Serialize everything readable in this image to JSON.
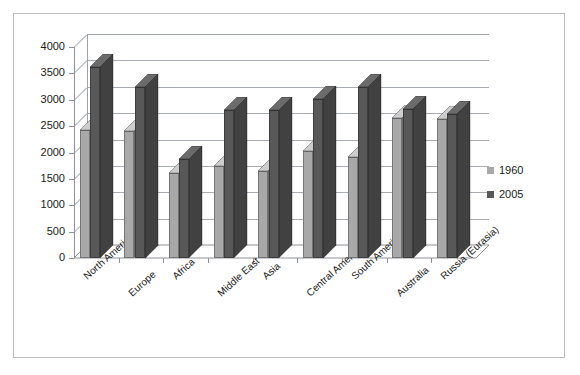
{
  "chart_data": {
    "type": "bar",
    "title": "",
    "subtitle": "",
    "xlabel": "",
    "ylabel": "",
    "ylim": [
      0,
      4000
    ],
    "yticks": [
      0,
      500,
      1000,
      1500,
      2000,
      2500,
      3000,
      3500,
      4000
    ],
    "grid": true,
    "legend_position": "right",
    "categories": [
      "North America",
      "Europe",
      "Africa",
      "Middle East",
      "Asia",
      "Central America",
      "South America",
      "Australia",
      "Russia (Eurasia)"
    ],
    "series": [
      {
        "name": "1960",
        "color": "#a8a8a8",
        "values": [
          2420,
          2400,
          1620,
          1740,
          1650,
          2030,
          1920,
          2650,
          2640
        ]
      },
      {
        "name": "2005",
        "color": "#585858",
        "values": [
          3620,
          3250,
          1870,
          2800,
          2800,
          3020,
          3240,
          2830,
          2730
        ]
      }
    ]
  },
  "legend": {
    "items": [
      {
        "label": "1960",
        "color": "#a8a8a8"
      },
      {
        "label": "2005",
        "color": "#585858"
      }
    ]
  },
  "frame": {
    "border_color": "#b9bcc2",
    "background": "#ffffff"
  }
}
